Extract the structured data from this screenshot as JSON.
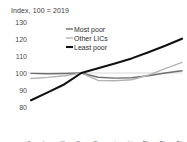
{
  "chart_data": {
    "type": "line",
    "title": "Index, 100 = 2019",
    "xlabel": "",
    "ylabel": "",
    "ylim": [
      80,
      130
    ],
    "yticks": [
      80,
      90,
      100,
      110,
      120,
      130
    ],
    "grid": false,
    "reference_line": 100,
    "legend_position": "top-center",
    "categories": [
      "2016",
      "2017",
      "2018",
      "2019",
      "2020",
      "2021",
      "2022",
      "2023f",
      "2024f",
      "2025f"
    ],
    "series": [
      {
        "name": "Most poor",
        "color": "#6e6e6e",
        "values": [
          99.8,
          99.6,
          99.7,
          100.0,
          97.5,
          97.0,
          97.2,
          98.4,
          100.0,
          101.3
        ]
      },
      {
        "name": "Other LICs",
        "color": "#b3b3b3",
        "values": [
          96.8,
          97.4,
          98.4,
          100.0,
          95.6,
          95.4,
          96.0,
          98.8,
          102.6,
          106.3
        ]
      },
      {
        "name": "Least poor",
        "color": "#111111",
        "values": [
          84.0,
          88.6,
          93.4,
          100.0,
          102.8,
          105.6,
          108.6,
          112.2,
          116.0,
          120.2
        ]
      }
    ]
  },
  "legend": {
    "items": [
      {
        "label": "Most poor"
      },
      {
        "label": "Other LICs"
      },
      {
        "label": "Least poor"
      }
    ]
  }
}
